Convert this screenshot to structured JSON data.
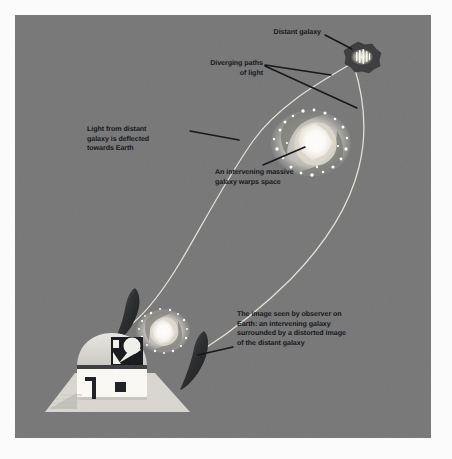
{
  "figure": {
    "background_color": "#777777",
    "border_color": "#fbfbfb",
    "text_color": "#15181c",
    "light_path_color": "#efeade",
    "leader_line_color": "#101316"
  },
  "labels": {
    "distant_galaxy": "Distant galaxy",
    "diverging_paths": "Diverging paths\nof light",
    "light_deflected": "Light from distant\ngalaxy is deflected\ntowards Earth",
    "intervening_galaxy": "An intervening massive\ngalaxy warps space",
    "observed_image": "The image seen by observer on\nEarth: an intervening galaxy\nsurrounded by a distorted image\nof the distant galaxy"
  },
  "objects": {
    "distant_galaxy": "distant-galaxy-blob",
    "lensing_galaxy": "intervening-massive-galaxy",
    "observed_galaxy": "observed-galaxy-image",
    "lensed_arc_left": "lensed-arc-left",
    "lensed_arc_right": "lensed-arc-right",
    "observatory": "observatory-telescope-dome",
    "light_path_left": "diverging-light-path-left",
    "light_path_right": "diverging-light-path-right"
  }
}
